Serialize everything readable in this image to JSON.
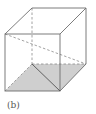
{
  "figure": {
    "caption": "(b)",
    "colors": {
      "edge": "#6e6e6e",
      "hidden_edge": "#8a8a8a",
      "shade": "#cfcfcf",
      "background": "#ffffff"
    },
    "vertices": {
      "front_top_left": [
        5,
        34
      ],
      "front_top_right": [
        60,
        34
      ],
      "front_bottom_left": [
        5,
        91
      ],
      "front_bottom_right": [
        60,
        91
      ],
      "back_top_left": [
        32,
        8
      ],
      "back_top_right": [
        86,
        8
      ],
      "back_bottom_left": [
        32,
        64
      ],
      "back_bottom_right": [
        86,
        64
      ]
    }
  }
}
